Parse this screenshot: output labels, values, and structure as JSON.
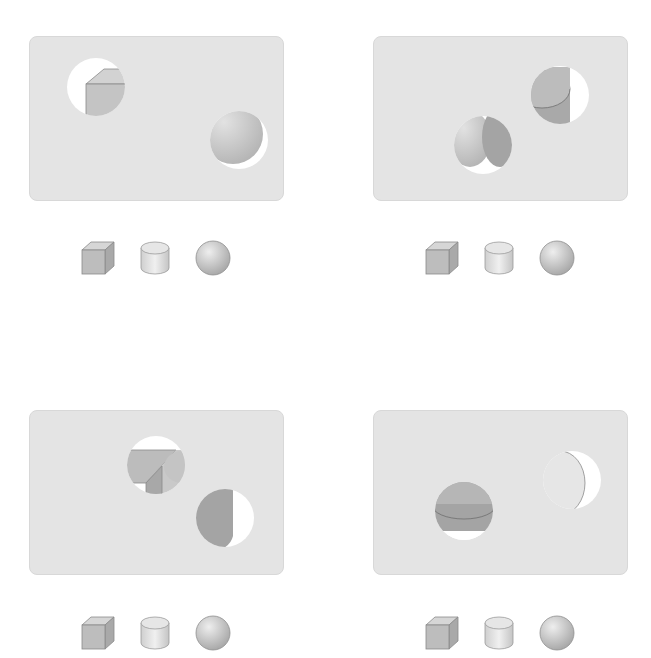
{
  "puzzle": {
    "description": "Four panels; each panel has circular holes revealing parts of 3D solids, with a row of three candidate solids below",
    "panels": [
      {
        "id": "top-left",
        "holes": [
          {
            "cx": 66,
            "cy": 38,
            "r": 30,
            "reveals": "cube corner"
          },
          {
            "cx": 180,
            "cy": 95,
            "r": 30,
            "reveals": "sphere"
          }
        ]
      },
      {
        "id": "top-right",
        "holes": [
          {
            "cx": 167,
            "cy": 58,
            "r": 30,
            "reveals": "cylinder"
          },
          {
            "cx": 99,
            "cy": 114,
            "r": 30,
            "reveals": "sphere and cylinder edge"
          }
        ]
      },
      {
        "id": "bottom-left",
        "holes": [
          {
            "cx": 121,
            "cy": 54,
            "r": 30,
            "reveals": "cube edges"
          },
          {
            "cx": 194,
            "cy": 109,
            "r": 30,
            "reveals": "cylinder side"
          }
        ]
      },
      {
        "id": "bottom-right",
        "holes": [
          {
            "cx": 86,
            "cy": 98,
            "r": 30,
            "reveals": "cylinder top"
          },
          {
            "cx": 198,
            "cy": 69,
            "r": 30,
            "reveals": "sphere"
          }
        ]
      }
    ],
    "options": [
      "cube",
      "cylinder",
      "sphere"
    ]
  },
  "colors": {
    "panel_bg": "#e4e4e4",
    "panel_border": "#d8d8d8",
    "hole_bg": "#ffffff",
    "shape_light": "#d6d6d6",
    "shape_mid": "#bdbdbd",
    "shape_dark": "#a9a9a9",
    "edge": "#8a8a8a"
  }
}
